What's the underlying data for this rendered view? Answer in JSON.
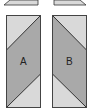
{
  "diagram": {
    "panels": [
      {
        "id": "A",
        "label": "A"
      },
      {
        "id": "B",
        "label": "B"
      }
    ],
    "colors": {
      "light_fill": "#d9d9d9",
      "dark_fill": "#a9a9a9",
      "stroke": "#333333"
    }
  }
}
